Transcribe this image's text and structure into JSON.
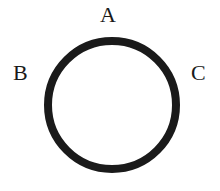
{
  "diagram": {
    "type": "circle-with-labels",
    "circle": {
      "cx": 112,
      "cy": 105,
      "r": 64,
      "stroke_width": 8,
      "stroke_color": "#1a1a1a",
      "fill": "#ffffff"
    },
    "labels": [
      {
        "id": "A",
        "text": "A",
        "position": "top"
      },
      {
        "id": "B",
        "text": "B",
        "position": "left"
      },
      {
        "id": "C",
        "text": "C",
        "position": "right"
      }
    ]
  }
}
